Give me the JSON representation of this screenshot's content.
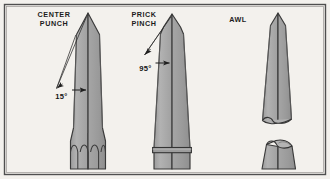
{
  "figure": {
    "background_color": "#f3f1ed",
    "border_color": "#4a4a4a",
    "metal_fill": "#a9a9a9",
    "metal_fill_light": "#b4b4b4",
    "metal_fill_dark": "#9a9a9a",
    "outline_color": "#3a3a3a",
    "leader_color": "#2b2b2b"
  },
  "tools": [
    {
      "id": "center-punch",
      "label_line1": "CENTER",
      "label_line2": "PUNCH",
      "angle_label": "15°",
      "point_style": "sharp conical point",
      "base_style": "three fluted / knurled grip arches"
    },
    {
      "id": "prick-punch",
      "label_line1": "PRICK",
      "label_line2": "PINCH",
      "angle_label": "95°",
      "point_style": "blunt conical point",
      "base_style": "collar band near base"
    },
    {
      "id": "awl",
      "label_line1": "AWL",
      "label_line2": "",
      "angle_label": "",
      "point_style": "slender tapered point",
      "base_style": "broken section, elliptical fracture ends"
    }
  ]
}
